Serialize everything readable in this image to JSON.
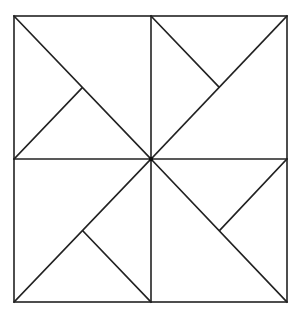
{
  "diagram": {
    "title": "",
    "stroke_color": "#222222",
    "background": "#ffffff",
    "outer_square": {
      "x1": 14,
      "y1": 16,
      "x2": 287,
      "y2": 302
    },
    "center": {
      "x": 151,
      "y": 159
    },
    "lines": [
      {
        "id": "vertical-midline",
        "x1": 151,
        "y1": 16,
        "x2": 151,
        "y2": 302
      },
      {
        "id": "horizontal-midline",
        "x1": 14,
        "y1": 159,
        "x2": 287,
        "y2": 159
      },
      {
        "id": "diagonal-top-left",
        "x1": 14,
        "y1": 16,
        "x2": 151,
        "y2": 159
      },
      {
        "id": "diagonal-top-right",
        "x1": 151,
        "y1": 159,
        "x2": 287,
        "y2": 16
      },
      {
        "id": "diagonal-bottom-left",
        "x1": 14,
        "y1": 302,
        "x2": 151,
        "y2": 159
      },
      {
        "id": "diagonal-bottom-right",
        "x1": 151,
        "y1": 159,
        "x2": 287,
        "y2": 302
      },
      {
        "id": "short-segment-top-left",
        "x1": 14,
        "y1": 159,
        "x2": 82,
        "y2": 88
      },
      {
        "id": "short-segment-top-right",
        "x1": 151,
        "y1": 16,
        "x2": 219,
        "y2": 87
      },
      {
        "id": "short-segment-bottom-left",
        "x1": 83,
        "y1": 231,
        "x2": 151,
        "y2": 302
      },
      {
        "id": "short-segment-bottom-right",
        "x1": 287,
        "y1": 159,
        "x2": 220,
        "y2": 230
      }
    ]
  }
}
